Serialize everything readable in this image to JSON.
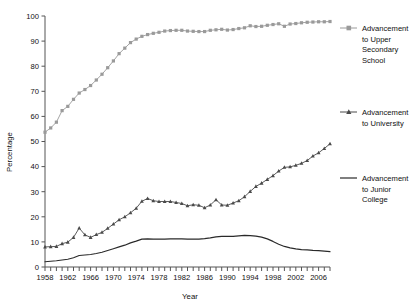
{
  "chart_data": {
    "type": "line",
    "title": "",
    "xlabel": "Year",
    "ylabel": "Percentage",
    "xlim": [
      1958,
      2008
    ],
    "ylim": [
      0,
      100
    ],
    "ytick_step": 10,
    "yticks": [
      0,
      10,
      20,
      30,
      40,
      50,
      60,
      70,
      80,
      90,
      100
    ],
    "xticks_labeled": [
      1958,
      1962,
      1966,
      1970,
      1974,
      1978,
      1982,
      1986,
      1990,
      1994,
      1998,
      2002,
      2006
    ],
    "xtick_minor_step": 1,
    "grid": false,
    "legend_position": "right",
    "x": [
      1958,
      1959,
      1960,
      1961,
      1962,
      1963,
      1964,
      1965,
      1966,
      1967,
      1968,
      1969,
      1970,
      1971,
      1972,
      1973,
      1974,
      1975,
      1976,
      1977,
      1978,
      1979,
      1980,
      1981,
      1982,
      1983,
      1984,
      1985,
      1986,
      1987,
      1988,
      1989,
      1990,
      1991,
      1992,
      1993,
      1994,
      1995,
      1996,
      1997,
      1998,
      1999,
      2000,
      2001,
      2002,
      2003,
      2004,
      2005,
      2006,
      2007,
      2008
    ],
    "series": [
      {
        "name": "Advancement to Upper Secondary School",
        "marker": "square",
        "color": "#9a9a9a",
        "values": [
          53.7,
          55.4,
          57.7,
          62.3,
          64.0,
          66.8,
          69.3,
          70.7,
          72.3,
          74.5,
          76.8,
          79.4,
          82.1,
          85.0,
          87.2,
          89.4,
          90.8,
          91.9,
          92.6,
          93.1,
          93.5,
          94.0,
          94.2,
          94.3,
          94.3,
          94.0,
          93.9,
          93.8,
          93.8,
          94.3,
          94.5,
          94.7,
          94.4,
          94.6,
          95.0,
          95.3,
          96.1,
          95.8,
          95.9,
          96.3,
          96.6,
          96.9,
          95.9,
          96.8,
          97.0,
          97.3,
          97.5,
          97.6,
          97.7,
          97.7,
          97.8
        ]
      },
      {
        "name": "Advancement to University",
        "marker": "triangle",
        "color": "#4a4a4a",
        "values": [
          8.0,
          8.1,
          8.2,
          9.3,
          9.9,
          11.8,
          15.5,
          12.8,
          11.8,
          12.9,
          13.8,
          15.4,
          17.1,
          18.8,
          20.0,
          21.6,
          23.4,
          26.2,
          27.3,
          26.4,
          26.1,
          26.1,
          26.1,
          25.7,
          25.3,
          24.4,
          24.8,
          24.6,
          23.6,
          24.7,
          26.8,
          24.7,
          24.6,
          25.5,
          26.4,
          28.0,
          30.1,
          32.1,
          33.4,
          34.9,
          36.4,
          38.2,
          39.7,
          39.9,
          40.5,
          41.3,
          42.4,
          44.2,
          45.5,
          47.2,
          49.1
        ]
      },
      {
        "name": "Advancement to Junior College",
        "marker": "none",
        "color": "#2a2a2a",
        "values": [
          2.1,
          2.3,
          2.5,
          2.8,
          3.1,
          3.7,
          4.6,
          4.8,
          5.0,
          5.4,
          5.9,
          6.6,
          7.3,
          8.0,
          8.7,
          9.6,
          10.3,
          11.1,
          11.2,
          11.1,
          11.1,
          11.1,
          11.2,
          11.2,
          11.2,
          11.1,
          11.1,
          11.1,
          11.3,
          11.6,
          12.0,
          12.2,
          12.2,
          12.2,
          12.4,
          12.6,
          12.5,
          12.3,
          11.9,
          11.2,
          10.2,
          9.1,
          8.2,
          7.6,
          7.2,
          6.9,
          6.8,
          6.6,
          6.5,
          6.3,
          6.1
        ]
      }
    ]
  },
  "legend": {
    "items": [
      {
        "label": "Advancement\nto Upper\nSecondary\nSchool",
        "lines": [
          "Advancement",
          "to Upper",
          "Secondary",
          "School"
        ],
        "marker": "square",
        "color": "#9a9a9a"
      },
      {
        "label": "Advancement\nto University",
        "lines": [
          "Advancement",
          "to University"
        ],
        "marker": "triangle",
        "color": "#4a4a4a"
      },
      {
        "label": "Advancement\nto Junior\nCollege",
        "lines": [
          "Advancement",
          "to Junior",
          "College"
        ],
        "marker": "none",
        "color": "#2a2a2a"
      }
    ]
  },
  "axes": {
    "y_title": "Percentage",
    "x_title": "Year"
  }
}
